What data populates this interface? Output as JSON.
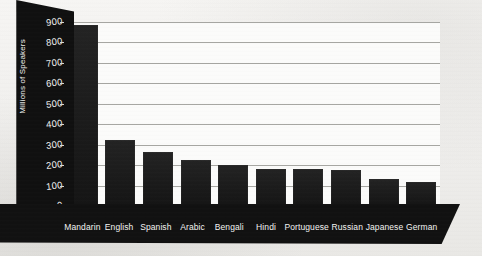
{
  "chart_data": {
    "type": "bar",
    "title": "",
    "xlabel": "",
    "ylabel": "Millions of Speakers",
    "ylim": [
      0,
      900
    ],
    "ytick_step": 100,
    "yticks": [
      "900",
      "800",
      "700",
      "600",
      "500",
      "400",
      "300",
      "200",
      "100",
      "0"
    ],
    "grid": true,
    "legend": "none",
    "bar_color": "#1d1d1d",
    "axis_panel_color": "#101010",
    "gridline_color": "#9a9a96",
    "background_color": "#f3f2f0",
    "categories": [
      "Mandarin",
      "English",
      "Spanish",
      "Arabic",
      "Bengali",
      "Hindi",
      "Portuguese",
      "Russian",
      "Japanese",
      "German"
    ],
    "values": [
      885,
      322,
      266,
      223,
      200,
      182,
      180,
      178,
      133,
      120
    ]
  },
  "axis": {
    "y_title": "Millions of Speakers"
  }
}
